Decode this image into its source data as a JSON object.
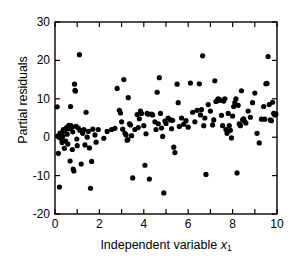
{
  "chart_data": {
    "type": "scatter",
    "title": "",
    "xlabel": "Independent variable x₁",
    "xlabel_main": "Independent variable ",
    "xlabel_var": "x",
    "xlabel_sub": "1",
    "ylabel": "Partial residuals",
    "xlim": [
      0,
      10
    ],
    "ylim": [
      -20,
      30
    ],
    "xticks": [
      0,
      1,
      2,
      3,
      4,
      5,
      6,
      7,
      8,
      9,
      10
    ],
    "xtick_labels": [
      "0",
      "",
      "2",
      "",
      "4",
      "",
      "6",
      "",
      "8",
      "",
      "10"
    ],
    "yticks": [
      -20,
      -10,
      0,
      10,
      20,
      30
    ],
    "ytick_labels": [
      "-20",
      "-10",
      "0",
      "10",
      "20",
      "30"
    ],
    "grid": false,
    "legend": null,
    "marker": "filled-circle",
    "marker_color": "#000000",
    "marker_size": 2.6,
    "frame": "box-all-sides-inward-ticks",
    "points": [
      [
        0.1,
        7.9
      ],
      [
        0.12,
        0.3
      ],
      [
        0.15,
        -4.2
      ],
      [
        0.18,
        0.0
      ],
      [
        0.2,
        -13.0
      ],
      [
        0.22,
        1.0
      ],
      [
        0.25,
        0.6
      ],
      [
        0.28,
        -0.4
      ],
      [
        0.3,
        1.2
      ],
      [
        0.32,
        -1.4
      ],
      [
        0.35,
        0.2
      ],
      [
        0.38,
        2.0
      ],
      [
        0.42,
        -2.9
      ],
      [
        0.45,
        1.6
      ],
      [
        0.48,
        -1.0
      ],
      [
        0.52,
        2.5
      ],
      [
        0.55,
        0.8
      ],
      [
        0.58,
        -1.8
      ],
      [
        0.62,
        3.1
      ],
      [
        0.65,
        2.2
      ],
      [
        0.68,
        -6.2
      ],
      [
        0.7,
        8.0
      ],
      [
        0.72,
        3.0
      ],
      [
        0.75,
        2.6
      ],
      [
        0.78,
        -3.2
      ],
      [
        0.8,
        1.4
      ],
      [
        0.82,
        -8.3
      ],
      [
        0.85,
        -8.8
      ],
      [
        0.88,
        13.8
      ],
      [
        0.9,
        12.2
      ],
      [
        0.92,
        12.0
      ],
      [
        0.95,
        2.8
      ],
      [
        0.98,
        -0.5
      ],
      [
        1.0,
        -2.2
      ],
      [
        1.05,
        2.4
      ],
      [
        1.1,
        21.5
      ],
      [
        1.12,
        1.8
      ],
      [
        1.18,
        -7.0
      ],
      [
        1.25,
        1.0
      ],
      [
        1.3,
        2.0
      ],
      [
        1.35,
        -2.0
      ],
      [
        1.4,
        6.5
      ],
      [
        1.45,
        0.0
      ],
      [
        1.5,
        1.5
      ],
      [
        1.55,
        -2.8
      ],
      [
        1.6,
        -13.3
      ],
      [
        1.65,
        -6.3
      ],
      [
        1.7,
        2.1
      ],
      [
        1.8,
        0.6
      ],
      [
        1.85,
        -1.3
      ],
      [
        1.95,
        2.0
      ],
      [
        2.2,
        -0.3
      ],
      [
        2.35,
        1.5
      ],
      [
        2.55,
        2.0
      ],
      [
        2.7,
        2.3
      ],
      [
        2.8,
        12.7
      ],
      [
        2.9,
        7.0
      ],
      [
        2.95,
        6.3
      ],
      [
        3.0,
        4.0
      ],
      [
        3.05,
        2.1
      ],
      [
        3.1,
        15.0
      ],
      [
        3.15,
        1.0
      ],
      [
        3.2,
        0.6
      ],
      [
        3.25,
        -0.8
      ],
      [
        3.28,
        -0.6
      ],
      [
        3.3,
        10.3
      ],
      [
        3.35,
        3.5
      ],
      [
        3.4,
        3.2
      ],
      [
        3.45,
        0.4
      ],
      [
        3.5,
        -10.6
      ],
      [
        3.6,
        2.0
      ],
      [
        3.7,
        5.9
      ],
      [
        3.75,
        2.5
      ],
      [
        3.8,
        4.8
      ],
      [
        3.85,
        6.8
      ],
      [
        3.9,
        6.2
      ],
      [
        4.0,
        3.0
      ],
      [
        4.05,
        -7.3
      ],
      [
        4.1,
        0.9
      ],
      [
        4.15,
        6.2
      ],
      [
        4.2,
        6.0
      ],
      [
        4.25,
        -10.9
      ],
      [
        4.35,
        6.0
      ],
      [
        4.4,
        5.8
      ],
      [
        4.5,
        4.0
      ],
      [
        4.55,
        2.0
      ],
      [
        4.6,
        11.7
      ],
      [
        4.65,
        3.5
      ],
      [
        4.7,
        15.5
      ],
      [
        4.75,
        6.2
      ],
      [
        4.8,
        2.4
      ],
      [
        4.85,
        0.2
      ],
      [
        4.9,
        -14.5
      ],
      [
        4.95,
        4.2
      ],
      [
        5.0,
        3.6
      ],
      [
        5.1,
        5.0
      ],
      [
        5.2,
        4.5
      ],
      [
        5.25,
        2.2
      ],
      [
        5.3,
        4.4
      ],
      [
        5.35,
        -2.6
      ],
      [
        5.4,
        -4.0
      ],
      [
        5.5,
        13.8
      ],
      [
        5.55,
        9.0
      ],
      [
        5.6,
        2.8
      ],
      [
        5.7,
        5.0
      ],
      [
        5.8,
        3.4
      ],
      [
        5.9,
        4.3
      ],
      [
        6.0,
        2.6
      ],
      [
        6.1,
        14.1
      ],
      [
        6.2,
        6.5
      ],
      [
        6.3,
        4.0
      ],
      [
        6.4,
        7.0
      ],
      [
        6.5,
        13.9
      ],
      [
        6.55,
        5.8
      ],
      [
        6.6,
        7.2
      ],
      [
        6.65,
        21.2
      ],
      [
        6.7,
        3.0
      ],
      [
        6.75,
        5.0
      ],
      [
        6.8,
        -9.7
      ],
      [
        6.9,
        8.5
      ],
      [
        7.0,
        6.8
      ],
      [
        7.1,
        3.2
      ],
      [
        7.15,
        4.5
      ],
      [
        7.2,
        14.7
      ],
      [
        7.25,
        9.3
      ],
      [
        7.3,
        9.5
      ],
      [
        7.35,
        10.0
      ],
      [
        7.4,
        9.8
      ],
      [
        7.45,
        9.6
      ],
      [
        7.5,
        5.7
      ],
      [
        7.55,
        3.0
      ],
      [
        7.6,
        9.4
      ],
      [
        7.65,
        10.0
      ],
      [
        7.7,
        2.0
      ],
      [
        7.75,
        1.0
      ],
      [
        7.8,
        6.2
      ],
      [
        7.85,
        3.0
      ],
      [
        7.9,
        1.8
      ],
      [
        7.95,
        -0.2
      ],
      [
        8.0,
        5.5
      ],
      [
        8.05,
        8.0
      ],
      [
        8.1,
        9.0
      ],
      [
        8.15,
        10.0
      ],
      [
        8.2,
        -9.3
      ],
      [
        8.25,
        8.3
      ],
      [
        8.3,
        3.5
      ],
      [
        8.35,
        3.0
      ],
      [
        8.4,
        12.1
      ],
      [
        8.45,
        4.5
      ],
      [
        8.5,
        4.8
      ],
      [
        8.55,
        4.0
      ],
      [
        8.6,
        3.7
      ],
      [
        8.7,
        6.8
      ],
      [
        8.8,
        5.2
      ],
      [
        8.9,
        9.0
      ],
      [
        9.0,
        11.5
      ],
      [
        9.1,
        1.0
      ],
      [
        9.2,
        -1.5
      ],
      [
        9.3,
        4.7
      ],
      [
        9.4,
        8.0
      ],
      [
        9.45,
        4.7
      ],
      [
        9.5,
        13.9
      ],
      [
        9.55,
        14.0
      ],
      [
        9.6,
        21.0
      ],
      [
        9.65,
        8.5
      ],
      [
        9.7,
        4.5
      ],
      [
        9.75,
        4.3
      ],
      [
        9.8,
        9.1
      ],
      [
        9.85,
        6.2
      ],
      [
        9.9,
        5.8
      ],
      [
        9.95,
        6.0
      ]
    ]
  }
}
